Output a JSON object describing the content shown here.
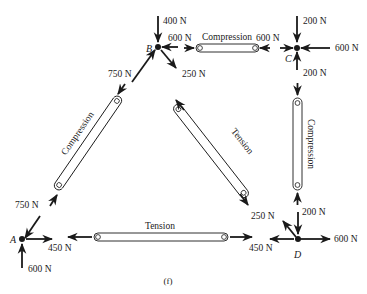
{
  "figure": {
    "caption": "(f)",
    "colors": {
      "ink": "#1a1a1a",
      "background": "#ffffff"
    }
  },
  "nodes": {
    "A": {
      "label": "A",
      "x": 22,
      "y": 243
    },
    "B": {
      "label": "B",
      "x": 158,
      "y": 45
    },
    "C": {
      "label": "C",
      "x": 297,
      "y": 45
    },
    "D": {
      "label": "D",
      "x": 298,
      "y": 243
    }
  },
  "members": {
    "AB": {
      "label": "Compression",
      "state": "compression"
    },
    "BC": {
      "label": "Compression",
      "state": "compression"
    },
    "BD": {
      "label": "Tension",
      "state": "tension"
    },
    "CD": {
      "label": "Compression",
      "state": "compression"
    },
    "AD": {
      "label": "Tension",
      "state": "tension"
    }
  },
  "forces": {
    "B_external_down": "400 N",
    "B_from_BC": "600 N",
    "BC_at_C": "600 N",
    "C_external_down": "200 N",
    "C_external_right": "600 N",
    "C_from_CD": "200 N",
    "B_from_AB": "750 N",
    "B_from_BD": "250 N",
    "A_from_AB": "750 N",
    "A_from_AD": "450 N",
    "A_reaction_up": "600 N",
    "D_from_AD": "450 N",
    "D_from_BD": "250 N",
    "D_from_CD": "200 N",
    "D_external_right": "600 N"
  }
}
